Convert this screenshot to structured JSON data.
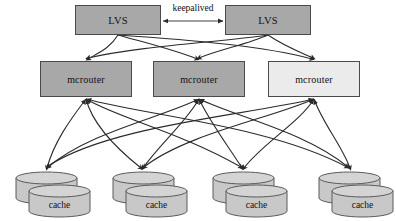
{
  "diagram": {
    "background": "#ffffff",
    "width": 396,
    "height": 221,
    "colors": {
      "node_fill_dark": "#a8a8a8",
      "node_fill_light": "#ebebeb",
      "node_border": "#4a4a4a",
      "cylinder_fill": "#c8c8c8",
      "cylinder_top_fill": "#d4d4d4",
      "cylinder_border": "#5a5a5a",
      "edge_stroke": "#2b2b2b",
      "text": "#111111"
    },
    "tiers": {
      "lvs": {
        "label": "LVS tier",
        "nodes": [
          {
            "id": "lvs-left",
            "label": "LVS",
            "fill": "#a8a8a8",
            "x": 75,
            "y": 5,
            "w": 86,
            "h": 30
          },
          {
            "id": "lvs-right",
            "label": "LVS",
            "fill": "#a8a8a8",
            "x": 225,
            "y": 5,
            "w": 86,
            "h": 30
          }
        ],
        "link": {
          "label": "keepalived",
          "style": "double-headed-arrow",
          "x1": 161,
          "x2": 225,
          "y": 21,
          "label_x": 163,
          "label_y": 2
        }
      },
      "mcrouter": {
        "label": "mcrouter tier",
        "nodes": [
          {
            "id": "mcrouter-1",
            "label": "mcrouter",
            "fill": "#a8a8a8",
            "x": 40,
            "y": 61,
            "w": 92,
            "h": 36
          },
          {
            "id": "mcrouter-2",
            "label": "mcrouter",
            "fill": "#a8a8a8",
            "x": 153,
            "y": 61,
            "w": 92,
            "h": 36
          },
          {
            "id": "mcrouter-3",
            "label": "mcrouter",
            "fill": "#ebebeb",
            "x": 268,
            "y": 61,
            "w": 92,
            "h": 36
          }
        ]
      },
      "cache": {
        "label": "cache tier",
        "nodes": [
          {
            "id": "cache-1",
            "label": "cache",
            "x": 15,
            "y": 172
          },
          {
            "id": "cache-2",
            "label": "cache",
            "x": 112,
            "y": 172
          },
          {
            "id": "cache-3",
            "label": "cache",
            "x": 212,
            "y": 172
          },
          {
            "id": "cache-4",
            "label": "cache",
            "x": 318,
            "y": 172
          }
        ],
        "cylinder": {
          "back_w": 63,
          "front_w": 63,
          "body_h": 26,
          "ellipse_ry": 6,
          "offset_x": 13,
          "offset_y": 13
        }
      }
    },
    "edges": {
      "lvs_to_mcrouter": {
        "style": "curved-arrow",
        "arrowhead": "filled-triangle-down",
        "sources": [
          {
            "id": "lvs-left",
            "x": 118,
            "y": 35
          },
          {
            "id": "lvs-right",
            "x": 268,
            "y": 35
          }
        ],
        "targets": [
          {
            "id": "mcrouter-1",
            "x": 86,
            "y": 61
          },
          {
            "id": "mcrouter-2",
            "x": 199,
            "y": 61
          },
          {
            "id": "mcrouter-3",
            "x": 314,
            "y": 61
          }
        ]
      },
      "mcrouter_to_cache": {
        "style": "curved-arrow",
        "arrowhead": "filled-triangle-both-ends",
        "sources": [
          {
            "id": "mcrouter-1",
            "x": 86,
            "y": 97
          },
          {
            "id": "mcrouter-2",
            "x": 199,
            "y": 97
          },
          {
            "id": "mcrouter-3",
            "x": 314,
            "y": 97
          }
        ],
        "targets": [
          {
            "id": "cache-1",
            "x": 46,
            "y": 172
          },
          {
            "id": "cache-2",
            "x": 143,
            "y": 172
          },
          {
            "id": "cache-3",
            "x": 243,
            "y": 172
          },
          {
            "id": "cache-4",
            "x": 349,
            "y": 172
          }
        ]
      }
    }
  }
}
